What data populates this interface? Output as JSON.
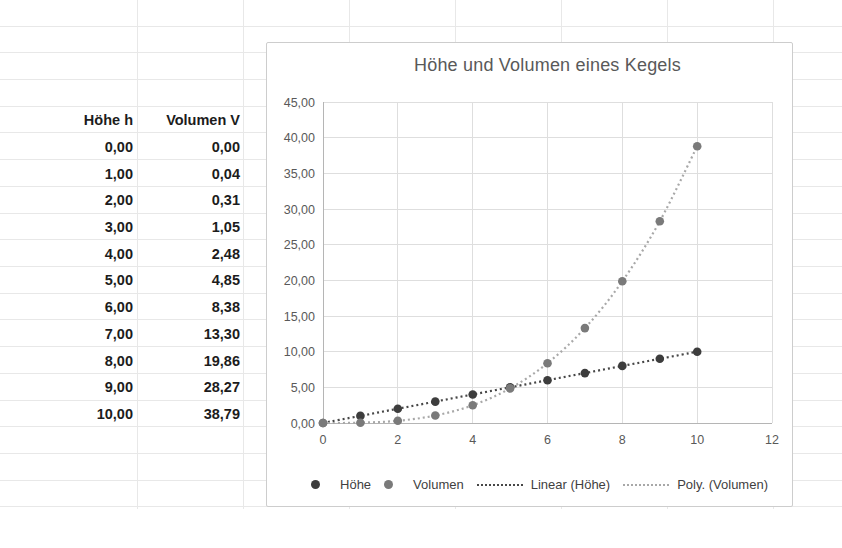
{
  "sheet": {
    "table": {
      "col1_header": "Höhe h",
      "col2_header": "Volumen V",
      "rows": [
        [
          "0,00",
          "0,00"
        ],
        [
          "1,00",
          "0,04"
        ],
        [
          "2,00",
          "0,31"
        ],
        [
          "3,00",
          "1,05"
        ],
        [
          "4,00",
          "2,48"
        ],
        [
          "5,00",
          "4,85"
        ],
        [
          "6,00",
          "8,38"
        ],
        [
          "7,00",
          "13,30"
        ],
        [
          "8,00",
          "19,86"
        ],
        [
          "9,00",
          "28,27"
        ],
        [
          "10,00",
          "38,79"
        ]
      ]
    }
  },
  "chart_data": {
    "type": "scatter",
    "title": "Höhe und Volumen eines Kegels",
    "x": [
      0,
      1,
      2,
      3,
      4,
      5,
      6,
      7,
      8,
      9,
      10
    ],
    "series": [
      {
        "name": "Höhe",
        "color": "#3d3d3d",
        "marker": "circle",
        "values": [
          0,
          1,
          2,
          3,
          4,
          5,
          6,
          7,
          8,
          9,
          10
        ]
      },
      {
        "name": "Volumen",
        "color": "#7a7a7a",
        "marker": "circle",
        "values": [
          0,
          0.04,
          0.31,
          1.05,
          2.48,
          4.85,
          8.38,
          13.3,
          19.86,
          28.27,
          38.79
        ]
      }
    ],
    "trendlines": [
      {
        "name": "Linear (Höhe)",
        "source": "Höhe",
        "color": "#474747",
        "style": "dotted",
        "fit": "linear"
      },
      {
        "name": "Poly. (Volumen)",
        "source": "Volumen",
        "color": "#a8a8a8",
        "style": "dotted",
        "fit": "polynomial"
      }
    ],
    "xlim": [
      0,
      12
    ],
    "ylim": [
      0,
      45
    ],
    "x_tick_values": [
      0,
      2,
      4,
      6,
      8,
      10,
      12
    ],
    "x_tick_labels": [
      "0",
      "2",
      "4",
      "6",
      "8",
      "10",
      "12"
    ],
    "y_tick_values": [
      0,
      5,
      10,
      15,
      20,
      25,
      30,
      35,
      40,
      45
    ],
    "y_tick_labels": [
      "0,00",
      "5,00",
      "10,00",
      "15,00",
      "20,00",
      "25,00",
      "30,00",
      "35,00",
      "40,00",
      "45,00"
    ],
    "grid": true,
    "legend_position": "bottom",
    "legend_items": [
      {
        "label": "Höhe",
        "marker": "dot",
        "color": "#3d3d3d"
      },
      {
        "label": "Volumen",
        "marker": "dot",
        "color": "#7a7a7a"
      },
      {
        "label": "Linear (Höhe)",
        "marker": "dotted-line",
        "color": "#474747"
      },
      {
        "label": "Poly. (Volumen)",
        "marker": "dotted-line",
        "color": "#a8a8a8"
      }
    ]
  }
}
